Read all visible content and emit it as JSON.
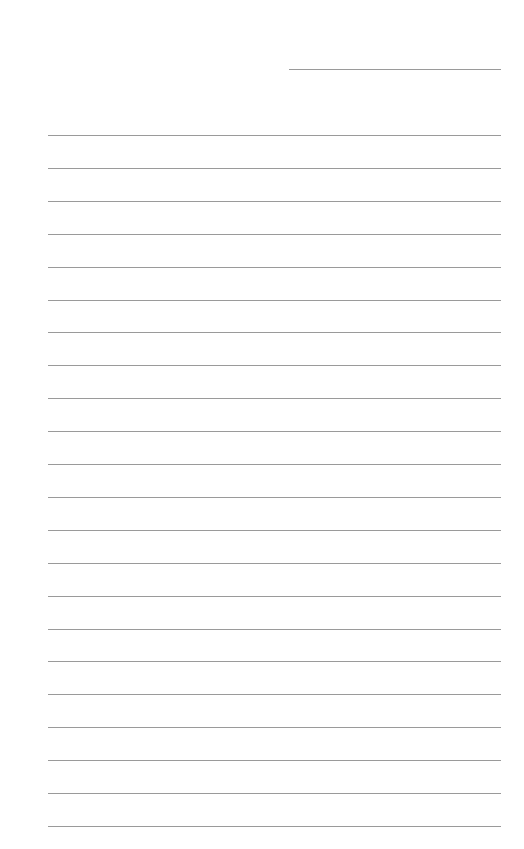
{
  "document": {
    "type": "lined-paper",
    "header_line": {
      "label": ""
    },
    "rules": {
      "count": 22,
      "first_y": 135,
      "spacing": 32.9,
      "color": "#9a9a9a"
    }
  }
}
